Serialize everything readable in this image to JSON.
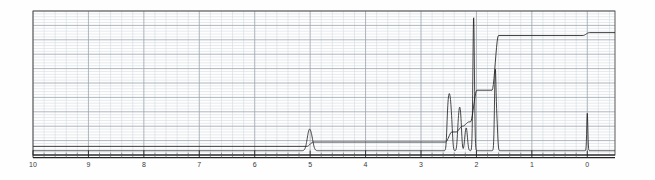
{
  "chart_data": {
    "type": "line",
    "title": "",
    "subtitle": "",
    "xlabel": "",
    "ylabel": "",
    "xlim": [
      10,
      -0.5
    ],
    "ylim": [
      0,
      100
    ],
    "grid": true,
    "legend": null,
    "axis_direction": "reversed",
    "xticks": [
      10,
      9,
      8,
      7,
      6,
      5,
      4,
      3,
      2,
      1,
      0
    ],
    "xtick_labels": [
      "10",
      "9",
      "8",
      "7",
      "6",
      "5",
      "4",
      "3",
      "2",
      "1",
      "0"
    ],
    "minor_ticks_per_major": 5,
    "series": [
      {
        "name": "spectrum",
        "kind": "peaks",
        "baseline": 3,
        "peaks": [
          {
            "ppm": 5.02,
            "height": 13,
            "width": 0.035,
            "label": "CH"
          },
          {
            "ppm": 4.97,
            "height": 6,
            "width": 0.03,
            "label": ""
          },
          {
            "ppm": 2.52,
            "height": 21,
            "width": 0.016,
            "label": ""
          },
          {
            "ppm": 2.495,
            "height": 26,
            "width": 0.016,
            "label": ""
          },
          {
            "ppm": 2.47,
            "height": 24,
            "width": 0.016,
            "label": ""
          },
          {
            "ppm": 2.445,
            "height": 15,
            "width": 0.016,
            "label": ""
          },
          {
            "ppm": 2.33,
            "height": 14,
            "width": 0.016,
            "label": ""
          },
          {
            "ppm": 2.305,
            "height": 21,
            "width": 0.016,
            "label": ""
          },
          {
            "ppm": 2.28,
            "height": 17,
            "width": 0.016,
            "label": ""
          },
          {
            "ppm": 2.2,
            "height": 9,
            "width": 0.018,
            "label": ""
          },
          {
            "ppm": 2.175,
            "height": 11,
            "width": 0.018,
            "label": ""
          },
          {
            "ppm": 2.05,
            "height": 93,
            "width": 0.014,
            "label": "CH3"
          },
          {
            "ppm": 1.66,
            "height": 55,
            "width": 0.014,
            "label": "CH3"
          },
          {
            "ppm": 1.63,
            "height": 18,
            "width": 0.014,
            "label": ""
          },
          {
            "ppm": 0.0,
            "height": 26,
            "width": 0.01,
            "label": "TMS"
          }
        ]
      },
      {
        "name": "integral",
        "kind": "step",
        "start_level": 6,
        "steps": [
          {
            "ppm": 5.0,
            "rise": 3
          },
          {
            "ppm": 2.5,
            "rise": 7
          },
          {
            "ppm": 2.31,
            "rise": 4
          },
          {
            "ppm": 2.19,
            "rise": 3
          },
          {
            "ppm": 2.05,
            "rise": 22
          },
          {
            "ppm": 1.66,
            "rise": 38
          },
          {
            "ppm": 0.02,
            "rise": 2
          }
        ]
      }
    ]
  },
  "axis": {
    "unit": "ppm",
    "ticks": [
      "10",
      "9",
      "8",
      "7",
      "6",
      "5",
      "4",
      "3",
      "2",
      "1",
      "0"
    ]
  },
  "colors": {
    "trace": "#1a1a1a",
    "integral": "#2b2b2b",
    "grid_major": "#9aa3ad",
    "grid_minor": "#cfd6dd",
    "axis": "#222222",
    "background": "#fefefe",
    "tick_text": "#3a3a3a"
  }
}
